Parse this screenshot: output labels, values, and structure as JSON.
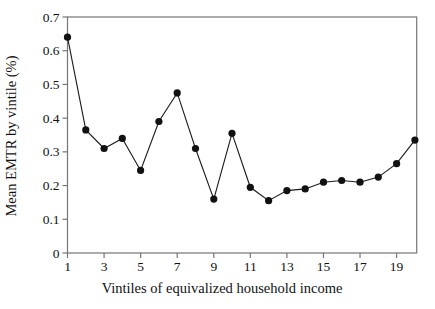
{
  "figure": {
    "background": "#ffffff"
  },
  "chart_data": {
    "type": "line",
    "title": "",
    "xlabel": "Vintiles of equivalized household income",
    "ylabel": "Mean EMTR by vintile (%)",
    "x": [
      1,
      2,
      3,
      4,
      5,
      6,
      7,
      8,
      9,
      10,
      11,
      12,
      13,
      14,
      15,
      16,
      17,
      18,
      19,
      20
    ],
    "values": [
      0.64,
      0.365,
      0.31,
      0.34,
      0.245,
      0.39,
      0.475,
      0.31,
      0.16,
      0.355,
      0.195,
      0.155,
      0.185,
      0.19,
      0.21,
      0.215,
      0.21,
      0.225,
      0.265,
      0.335
    ],
    "xtick_values": [
      1,
      3,
      5,
      7,
      9,
      11,
      13,
      15,
      17,
      19
    ],
    "xtick_labels": [
      "1",
      "3",
      "5",
      "7",
      "9",
      "11",
      "13",
      "15",
      "17",
      "19"
    ],
    "ytick_values": [
      0,
      0.1,
      0.2,
      0.3,
      0.4,
      0.5,
      0.6,
      0.7
    ],
    "ytick_labels": [
      "0",
      "0.1",
      "0.2",
      "0.3",
      "0.4",
      "0.5",
      "0.6",
      "0.7"
    ],
    "xlim": [
      1,
      20.1
    ],
    "ylim": [
      0,
      0.7
    ],
    "grid": false,
    "legend": "none",
    "marker": "filled-circle",
    "colors": {
      "line": "#1a1a1a",
      "marker": "#111111",
      "frame": "#767676",
      "text": "#111111"
    }
  }
}
